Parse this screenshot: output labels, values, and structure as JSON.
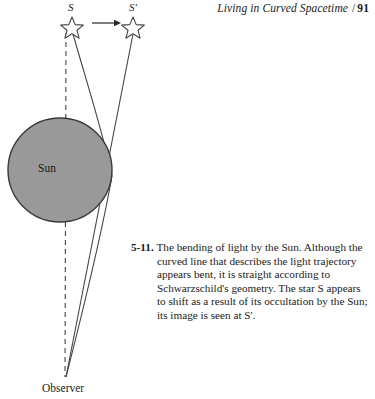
{
  "running_head": {
    "title": "Living in Curved Spacetime",
    "separator": "/",
    "page_number": "91"
  },
  "figure": {
    "labels": {
      "star_true": "S",
      "star_apparent": "S'",
      "sun": "Sun",
      "observer": "Observer"
    },
    "icons": {
      "star_true": "star-icon",
      "star_apparent": "star-icon",
      "shift_arrow": "right-arrow-icon",
      "sun_disk": "sun-disk-icon",
      "sight_line": "dashed-line-icon",
      "light_ray": "curved-ray-icon",
      "apparent_ray": "straight-ray-icon"
    },
    "colors": {
      "sun_fill": "#999999",
      "sun_stroke": "#3a3a3a",
      "ray_stroke": "#444444",
      "text": "#1a1a1a"
    }
  },
  "caption": {
    "number": "5-11.",
    "text": "The bending of light by the Sun. Although the curved line that describes the light trajectory appears bent, it is straight according to Schwarzschild's geometry. The star S appears to shift as a result of its occultation by the Sun; its image is seen at S'."
  }
}
